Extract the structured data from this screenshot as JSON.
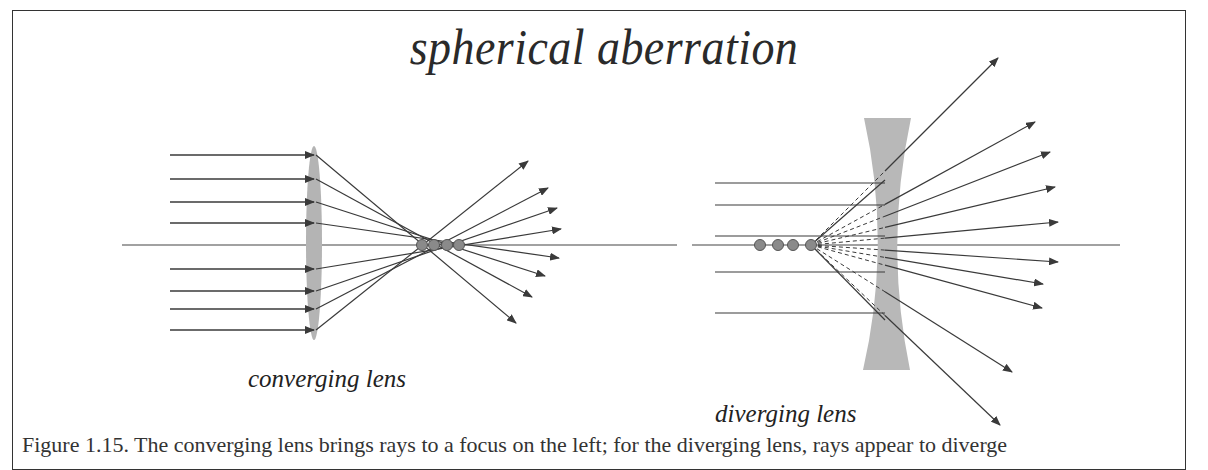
{
  "title": "spherical aberration",
  "labels": {
    "converging": "converging lens",
    "diverging": "diverging lens"
  },
  "caption": "Figure 1.15. The converging lens brings rays to a focus on the left; for the diverging lens, rays appear to diverge",
  "colors": {
    "ray": "#3a3a3a",
    "lens": "#b4b4b4",
    "focus_dot": "#8a8a8a",
    "frame": "#333333"
  },
  "converging": {
    "axis_y": 245,
    "axis_x": [
      122,
      677
    ],
    "lens": {
      "cx": 313,
      "cy": 243,
      "rx": 8,
      "ry": 97
    },
    "incoming_start_x": 170,
    "incoming_rays_y": [
      155,
      179,
      202,
      223,
      269,
      291,
      309,
      330
    ],
    "focal_points_x": [
      422,
      434,
      447,
      459
    ],
    "outgoing_tips": [
      [
        528,
        161
      ],
      [
        548,
        188
      ],
      [
        557,
        208
      ],
      [
        561,
        229
      ],
      [
        559,
        258
      ],
      [
        545,
        276
      ],
      [
        532,
        297
      ],
      [
        516,
        323
      ]
    ]
  },
  "diverging": {
    "axis_y": 245,
    "axis_x": [
      692,
      1120
    ],
    "focal_points_x": [
      760,
      778,
      793,
      811
    ],
    "incoming_start_x": 715,
    "incoming_rays_y": [
      183,
      205,
      236,
      272,
      313
    ],
    "outgoing_tips": [
      [
        998,
        58
      ],
      [
        1035,
        122
      ],
      [
        1050,
        152
      ],
      [
        1055,
        187
      ],
      [
        1058,
        222
      ],
      [
        1058,
        262
      ],
      [
        1043,
        284
      ],
      [
        1042,
        308
      ],
      [
        1012,
        372
      ],
      [
        1000,
        425
      ]
    ]
  }
}
